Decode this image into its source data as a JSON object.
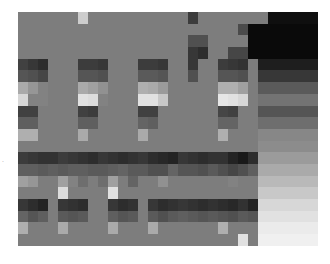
{
  "chart_data": {
    "type": "heatmap",
    "title": "",
    "xlabel": "",
    "ylabel": "",
    "colormap": "grayscale",
    "value_range": [
      0,
      255
    ],
    "grid": {
      "cols": 30,
      "rows": 20
    },
    "rows": [
      [
        125,
        125,
        125,
        125,
        125,
        125,
        205,
        125,
        125,
        125,
        125,
        125,
        125,
        125,
        125,
        125,
        125,
        60,
        125,
        125,
        125,
        125,
        125,
        125,
        125,
        15,
        15,
        15,
        15,
        15
      ],
      [
        125,
        125,
        125,
        125,
        125,
        125,
        125,
        125,
        125,
        125,
        125,
        125,
        125,
        125,
        125,
        125,
        125,
        125,
        125,
        125,
        125,
        125,
        75,
        10,
        10,
        10,
        10,
        10,
        10,
        10
      ],
      [
        125,
        125,
        125,
        125,
        125,
        125,
        125,
        125,
        125,
        125,
        125,
        125,
        125,
        125,
        125,
        125,
        125,
        80,
        80,
        125,
        125,
        125,
        125,
        10,
        10,
        10,
        10,
        10,
        10,
        10
      ],
      [
        125,
        125,
        125,
        125,
        125,
        125,
        125,
        125,
        125,
        125,
        125,
        125,
        125,
        125,
        125,
        125,
        125,
        55,
        45,
        125,
        125,
        70,
        70,
        10,
        10,
        10,
        10,
        10,
        10,
        10
      ],
      [
        65,
        55,
        45,
        125,
        125,
        125,
        60,
        60,
        55,
        125,
        125,
        125,
        60,
        60,
        55,
        125,
        125,
        55,
        125,
        125,
        60,
        55,
        50,
        125,
        30,
        30,
        30,
        30,
        30,
        30
      ],
      [
        85,
        80,
        70,
        125,
        125,
        125,
        85,
        85,
        80,
        125,
        125,
        125,
        90,
        90,
        85,
        125,
        125,
        80,
        125,
        125,
        85,
        85,
        80,
        125,
        55,
        55,
        55,
        55,
        55,
        55
      ],
      [
        170,
        150,
        130,
        125,
        125,
        125,
        170,
        160,
        145,
        125,
        125,
        125,
        175,
        170,
        155,
        125,
        125,
        125,
        125,
        125,
        175,
        175,
        160,
        125,
        90,
        90,
        90,
        90,
        90,
        90
      ],
      [
        215,
        130,
        130,
        125,
        125,
        125,
        225,
        220,
        130,
        125,
        125,
        125,
        225,
        225,
        200,
        125,
        125,
        125,
        125,
        125,
        230,
        225,
        215,
        125,
        115,
        115,
        115,
        115,
        115,
        115
      ],
      [
        65,
        65,
        125,
        125,
        125,
        125,
        65,
        60,
        125,
        125,
        125,
        125,
        65,
        65,
        125,
        125,
        125,
        125,
        125,
        125,
        70,
        65,
        125,
        125,
        85,
        85,
        85,
        85,
        85,
        85
      ],
      [
        95,
        95,
        125,
        125,
        125,
        125,
        95,
        95,
        125,
        125,
        125,
        125,
        100,
        95,
        125,
        125,
        125,
        125,
        125,
        125,
        100,
        100,
        125,
        125,
        110,
        110,
        110,
        110,
        110,
        110
      ],
      [
        175,
        175,
        125,
        125,
        125,
        125,
        170,
        125,
        125,
        125,
        125,
        125,
        170,
        125,
        125,
        125,
        125,
        125,
        125,
        125,
        175,
        125,
        125,
        125,
        135,
        135,
        135,
        135,
        135,
        135
      ],
      [
        125,
        125,
        125,
        125,
        125,
        125,
        125,
        125,
        125,
        125,
        125,
        125,
        125,
        125,
        125,
        125,
        125,
        125,
        125,
        125,
        125,
        125,
        125,
        125,
        140,
        140,
        140,
        140,
        140,
        140
      ],
      [
        60,
        55,
        50,
        50,
        60,
        55,
        50,
        45,
        55,
        50,
        45,
        50,
        55,
        45,
        40,
        35,
        55,
        50,
        45,
        50,
        50,
        35,
        25,
        45,
        155,
        155,
        155,
        155,
        155,
        155
      ],
      [
        95,
        95,
        90,
        95,
        90,
        95,
        95,
        90,
        90,
        95,
        100,
        90,
        90,
        80,
        80,
        100,
        85,
        85,
        80,
        90,
        80,
        70,
        80,
        95,
        170,
        170,
        170,
        170,
        170,
        170
      ],
      [
        160,
        150,
        125,
        125,
        160,
        130,
        110,
        125,
        110,
        160,
        125,
        100,
        125,
        125,
        145,
        125,
        125,
        125,
        125,
        125,
        125,
        130,
        125,
        125,
        185,
        185,
        185,
        185,
        185,
        185
      ],
      [
        125,
        125,
        125,
        125,
        220,
        125,
        125,
        125,
        125,
        225,
        125,
        125,
        125,
        125,
        125,
        125,
        125,
        125,
        125,
        125,
        125,
        125,
        125,
        125,
        200,
        200,
        200,
        200,
        200,
        200
      ],
      [
        55,
        45,
        35,
        125,
        55,
        50,
        45,
        125,
        125,
        55,
        45,
        50,
        125,
        55,
        45,
        50,
        55,
        50,
        45,
        50,
        45,
        40,
        50,
        35,
        215,
        215,
        215,
        215,
        215,
        215
      ],
      [
        100,
        85,
        95,
        125,
        90,
        85,
        90,
        125,
        125,
        95,
        85,
        90,
        125,
        90,
        80,
        90,
        95,
        90,
        85,
        90,
        85,
        80,
        90,
        85,
        225,
        225,
        225,
        225,
        225,
        225
      ],
      [
        175,
        125,
        125,
        125,
        170,
        125,
        125,
        125,
        125,
        170,
        125,
        125,
        125,
        170,
        125,
        125,
        125,
        125,
        125,
        125,
        175,
        125,
        125,
        125,
        235,
        235,
        235,
        235,
        235,
        235
      ],
      [
        125,
        125,
        125,
        125,
        125,
        125,
        125,
        125,
        125,
        125,
        125,
        125,
        125,
        125,
        125,
        125,
        125,
        125,
        125,
        125,
        125,
        125,
        225,
        125,
        240,
        240,
        240,
        240,
        240,
        240
      ]
    ]
  },
  "side_label": "."
}
